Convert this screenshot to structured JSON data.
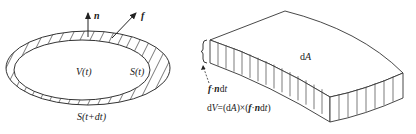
{
  "figure": {
    "left_panel": {
      "description": "Control volume V(t) bounded by surface S(t), moving to S(t+dt)",
      "labels": {
        "normal_vector": "n",
        "velocity_vector": "f",
        "volume": "V(t)",
        "inner_surface": "S(t)",
        "outer_surface": "S(t+dt)"
      }
    },
    "right_panel": {
      "description": "Surface element dA swept by f·n dt forming slab volume dV",
      "labels": {
        "area_element": "dA",
        "thickness_f": "f",
        "thickness_dot": "·",
        "thickness_n": "n",
        "thickness_dt": "dt",
        "volume_eq_prefix": "dV=(dA)×(",
        "volume_eq_f": "f",
        "volume_eq_dot": "·",
        "volume_eq_n": "n",
        "volume_eq_suffix": "dt)"
      }
    },
    "colors": {
      "stroke": "#333333",
      "background": "#ffffff"
    }
  }
}
